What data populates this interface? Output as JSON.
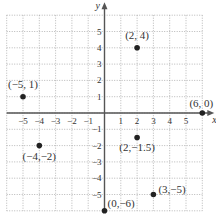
{
  "chart_data": {
    "type": "scatter",
    "title": "",
    "xlabel": "x",
    "ylabel": "y",
    "xlim": [
      -6,
      6
    ],
    "ylim": [
      -6,
      6
    ],
    "grid": true,
    "x_ticks": [
      -5,
      -4,
      -3,
      -2,
      -1,
      1,
      2,
      3,
      4,
      5
    ],
    "y_ticks": [
      -5,
      -4,
      -3,
      -2,
      -1,
      1,
      2,
      3,
      4,
      5
    ],
    "x_tick_labels": [
      "−5",
      "−4",
      "−3",
      "−2",
      "−1",
      "1",
      "2",
      "3",
      "4",
      "5"
    ],
    "y_tick_labels": [
      "−5",
      "−4",
      "−3",
      "−2",
      "−1",
      "1",
      "2",
      "3",
      "4",
      "5"
    ],
    "points": [
      {
        "x": 2,
        "y": 4,
        "label": "(2, 4)"
      },
      {
        "x": -5,
        "y": 1,
        "label": "(−5, 1)"
      },
      {
        "x": 6,
        "y": 0,
        "label": "(6, 0)"
      },
      {
        "x": -4,
        "y": -2,
        "label": "(−4,−2)"
      },
      {
        "x": 2,
        "y": -1.5,
        "label": "(2,−1.5)"
      },
      {
        "x": 3,
        "y": -5,
        "label": "(3,−5)"
      },
      {
        "x": 0,
        "y": -6,
        "label": "(0,−6)"
      }
    ],
    "colors": {
      "grid": "#9a9a9a",
      "axis": "#555555",
      "point": "#222222",
      "text": "#333333"
    }
  }
}
